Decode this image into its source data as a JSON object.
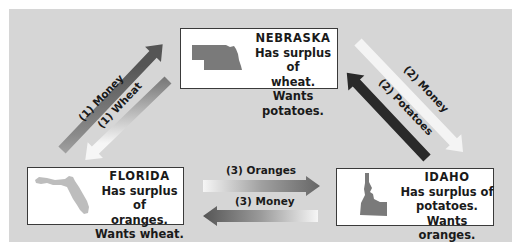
{
  "states": {
    "nebraska": {
      "name": "NEBRASKA",
      "line1": "Has surplus of",
      "line2": "wheat.",
      "line3": "Wants potatoes.",
      "icon": "nebraska-map-icon"
    },
    "florida": {
      "name": "FLORIDA",
      "line1": "Has surplus of",
      "line2": "oranges.",
      "line3": "Wants wheat.",
      "icon": "florida-map-icon"
    },
    "idaho": {
      "name": "IDAHO",
      "line1": "Has surplus of",
      "line2": "potatoes.",
      "line3": "Wants oranges.",
      "icon": "idaho-map-icon"
    }
  },
  "arrows": {
    "a1_money": "(1) Money",
    "a1_wheat": "(1) Wheat",
    "a2_money": "(2) Money",
    "a2_potatoes": "(2) Potatoes",
    "a3_oranges": "(3) Oranges",
    "a3_money": "(3) Money"
  },
  "colors": {
    "panel": "#d6d6d6",
    "arrow_dark": "#3a3a3a",
    "arrow_light": "#f4f4f4",
    "map_dark": "#7a7a7a",
    "map_light": "#bdbdbd"
  }
}
